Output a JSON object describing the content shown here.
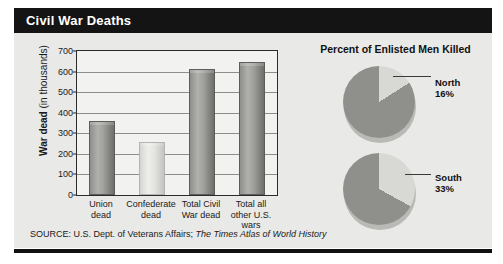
{
  "title": "Civil War Deaths",
  "source": {
    "prefix": "SOURCE: U.S. Dept. of Veterans Affairs; ",
    "italic": "The Times Atlas of World History"
  },
  "pie_heading": "Percent of Enlisted Men Killed",
  "chart_data": [
    {
      "type": "bar",
      "title": "Civil War Deaths",
      "xlabel": "",
      "ylabel": "War dead (in thousands)",
      "ylabel_bold": "War dead",
      "ylabel_rest": " (in thousands)",
      "categories": [
        "Union dead",
        "Confederate dead",
        "Total Civil War dead",
        "Total all other U.S. wars"
      ],
      "category_lines": [
        [
          "Union",
          "dead"
        ],
        [
          "Confederate",
          "dead"
        ],
        [
          "Total Civil",
          "War dead"
        ],
        [
          "Total all",
          "other U.S.",
          "wars"
        ]
      ],
      "values": [
        360,
        258,
        612,
        645
      ],
      "ylim": [
        0,
        700
      ],
      "yticks": [
        0,
        100,
        200,
        300,
        400,
        500,
        600,
        700
      ],
      "grid": true,
      "legend": "none",
      "bar_styles": [
        "dark",
        "light",
        "dark",
        "dark"
      ]
    },
    {
      "type": "pie",
      "title": "Percent of Enlisted Men Killed",
      "name": "North",
      "labels": [
        "North killed",
        "North survived"
      ],
      "values": [
        16,
        84
      ],
      "label_name": "North",
      "label_value": "16%"
    },
    {
      "type": "pie",
      "title": "Percent of Enlisted Men Killed",
      "name": "South",
      "labels": [
        "South killed",
        "South survived"
      ],
      "values": [
        33,
        67
      ],
      "label_name": "South",
      "label_value": "33%"
    }
  ],
  "colors": {
    "title_bar": "#141414",
    "panel_bg": "#e9e9e7",
    "plot_bg": "#f2f2f0",
    "bar_dark": "#9a9a97",
    "bar_light": "#e4e4e1",
    "pie_slice_dark": "#8f8f8c",
    "pie_slice_light": "#d8d8d5"
  }
}
